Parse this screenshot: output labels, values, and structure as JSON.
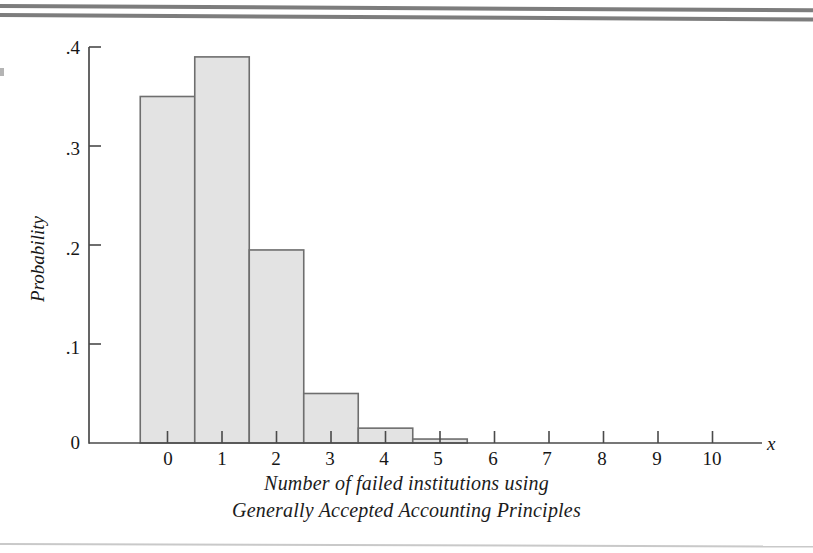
{
  "chart_data": {
    "type": "bar",
    "title": "",
    "subtitle": "",
    "xlabel": "Number of failed institutions using Generally Accepted Accounting Principles",
    "ylabel": "Probability",
    "x_variable_symbol": "x",
    "categories": [
      0,
      1,
      2,
      3,
      4,
      5,
      6,
      7,
      8,
      9,
      10
    ],
    "values": [
      0.35,
      0.39,
      0.195,
      0.05,
      0.015,
      0.004,
      0,
      0,
      0,
      0,
      0
    ],
    "xtick_labels": [
      "0",
      "1",
      "2",
      "3",
      "4",
      "5",
      "6",
      "7",
      "8",
      "9",
      "10"
    ],
    "ytick_labels": [
      "0",
      ".1",
      ".2",
      ".3",
      ".4"
    ],
    "ytick_values": [
      0,
      0.1,
      0.2,
      0.3,
      0.4
    ],
    "ylim": [
      0,
      0.4
    ],
    "xlim": [
      -0.5,
      10.8
    ],
    "grid": false,
    "legend": false,
    "legend_position": "none",
    "bar_fill_color": "#e3e3e3",
    "bar_edge_color": "#6e6e6e",
    "axis_color": "#4a4a4a",
    "bar_width_units": 1.0
  },
  "caption": {
    "line1": "Number of failed institutions using",
    "line2": "Generally Accepted Accounting Principles"
  },
  "axes": {
    "y_title": "Probability",
    "x_symbol": "x"
  }
}
